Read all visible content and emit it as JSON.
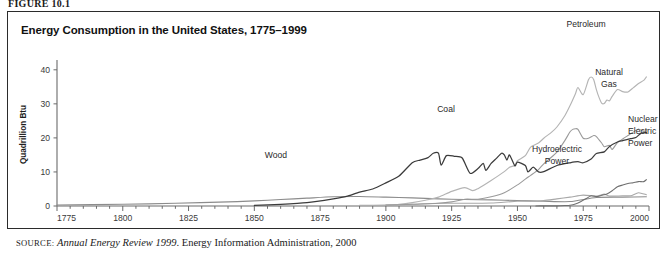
{
  "figure": {
    "label": "FIGURE 10.1",
    "title": "Energy Consumption in the United States, 1775–1999",
    "source_prefix": "source:",
    "source_italic": "Annual Energy Review 1999",
    "source_rest": ". Energy Information Administration, 2000"
  },
  "axes": {
    "ylabel": "Quadrillion Btu",
    "yticks": [
      "0",
      "10",
      "20",
      "30",
      "40"
    ],
    "xticks": [
      "1775",
      "1800",
      "1825",
      "1850",
      "1875",
      "1900",
      "1925",
      "1950",
      "1975",
      "2000"
    ]
  },
  "labels": {
    "wood": "Wood",
    "coal": "Coal",
    "petroleum": "Petroleum",
    "natural_gas_l1": "Natural",
    "natural_gas_l2": "Gas",
    "hydro_l1": "Hydroelectric",
    "hydro_l2": "Power",
    "nuclear_l1": "Nuclear",
    "nuclear_l2": "Electric",
    "nuclear_l3": "Power"
  },
  "colors": {
    "wood": "#8c8c8c",
    "coal": "#3b3b3b",
    "petroleum": "#b4b4b4",
    "natural_gas": "#9a9a9a",
    "hydro": "#a8a8a8",
    "nuclear": "#6f6f6f",
    "axis": "#6b6b6b",
    "border": "#2b2b2b"
  },
  "chart_data": {
    "type": "line",
    "title": "Energy Consumption in the United States, 1775–1999",
    "xlabel": "",
    "ylabel": "Quadrillion Btu",
    "xlim": [
      1775,
      2000
    ],
    "ylim": [
      0,
      42
    ],
    "yticks": [
      0,
      10,
      20,
      30,
      40
    ],
    "xticks": [
      1775,
      1800,
      1825,
      1850,
      1875,
      1900,
      1925,
      1950,
      1975,
      2000
    ],
    "grid": false,
    "legend": "inline-annotations",
    "units": "Quadrillion Btu",
    "series": [
      {
        "name": "Wood",
        "color": "#8c8c8c",
        "points": [
          [
            1775,
            0.3
          ],
          [
            1800,
            0.5
          ],
          [
            1820,
            0.8
          ],
          [
            1840,
            1.2
          ],
          [
            1850,
            1.5
          ],
          [
            1860,
            1.9
          ],
          [
            1870,
            2.3
          ],
          [
            1880,
            2.7
          ],
          [
            1890,
            2.8
          ],
          [
            1900,
            2.6
          ],
          [
            1910,
            2.4
          ],
          [
            1920,
            2.1
          ],
          [
            1930,
            1.9
          ],
          [
            1940,
            1.8
          ],
          [
            1950,
            1.6
          ],
          [
            1960,
            1.4
          ],
          [
            1970,
            1.3
          ],
          [
            1980,
            2.5
          ],
          [
            1990,
            2.6
          ],
          [
            1999,
            2.7
          ]
        ]
      },
      {
        "name": "Coal",
        "color": "#3b3b3b",
        "points": [
          [
            1850,
            0.2
          ],
          [
            1860,
            0.5
          ],
          [
            1870,
            1.0
          ],
          [
            1880,
            2.1
          ],
          [
            1885,
            2.8
          ],
          [
            1890,
            4.1
          ],
          [
            1895,
            5.0
          ],
          [
            1900,
            6.8
          ],
          [
            1905,
            8.8
          ],
          [
            1910,
            12.7
          ],
          [
            1913,
            13.5
          ],
          [
            1916,
            14.2
          ],
          [
            1918,
            15.5
          ],
          [
            1920,
            15.5
          ],
          [
            1921,
            12.0
          ],
          [
            1923,
            14.8
          ],
          [
            1926,
            14.6
          ],
          [
            1929,
            14.1
          ],
          [
            1932,
            9.6
          ],
          [
            1935,
            11.0
          ],
          [
            1937,
            12.5
          ],
          [
            1938,
            10.5
          ],
          [
            1940,
            12.5
          ],
          [
            1942,
            14.0
          ],
          [
            1944,
            15.5
          ],
          [
            1945,
            15.0
          ],
          [
            1946,
            13.5
          ],
          [
            1947,
            15.0
          ],
          [
            1949,
            11.8
          ],
          [
            1950,
            12.9
          ],
          [
            1953,
            11.9
          ],
          [
            1954,
            10.0
          ],
          [
            1956,
            11.4
          ],
          [
            1958,
            10.0
          ],
          [
            1960,
            10.1
          ],
          [
            1965,
            11.9
          ],
          [
            1970,
            12.7
          ],
          [
            1973,
            13.0
          ],
          [
            1975,
            12.7
          ],
          [
            1978,
            13.8
          ],
          [
            1980,
            15.4
          ],
          [
            1983,
            15.9
          ],
          [
            1985,
            17.5
          ],
          [
            1988,
            18.8
          ],
          [
            1990,
            19.2
          ],
          [
            1993,
            19.8
          ],
          [
            1995,
            20.1
          ],
          [
            1997,
            21.4
          ],
          [
            1999,
            21.6
          ]
        ]
      },
      {
        "name": "Petroleum",
        "color": "#b4b4b4",
        "points": [
          [
            1900,
            0.2
          ],
          [
            1905,
            0.5
          ],
          [
            1910,
            1.0
          ],
          [
            1915,
            1.7
          ],
          [
            1920,
            2.6
          ],
          [
            1925,
            4.3
          ],
          [
            1930,
            5.4
          ],
          [
            1933,
            4.5
          ],
          [
            1935,
            5.1
          ],
          [
            1940,
            7.5
          ],
          [
            1945,
            10.1
          ],
          [
            1947,
            11.4
          ],
          [
            1949,
            11.9
          ],
          [
            1950,
            13.3
          ],
          [
            1953,
            14.8
          ],
          [
            1955,
            17.3
          ],
          [
            1958,
            18.5
          ],
          [
            1960,
            19.9
          ],
          [
            1963,
            21.7
          ],
          [
            1965,
            23.2
          ],
          [
            1968,
            26.5
          ],
          [
            1970,
            29.5
          ],
          [
            1972,
            32.9
          ],
          [
            1973,
            34.8
          ],
          [
            1975,
            32.7
          ],
          [
            1977,
            37.1
          ],
          [
            1978,
            37.9
          ],
          [
            1979,
            37.1
          ],
          [
            1980,
            34.2
          ],
          [
            1981,
            31.9
          ],
          [
            1982,
            30.2
          ],
          [
            1983,
            30.1
          ],
          [
            1984,
            31.1
          ],
          [
            1985,
            30.9
          ],
          [
            1986,
            32.2
          ],
          [
            1988,
            34.2
          ],
          [
            1990,
            33.6
          ],
          [
            1992,
            33.5
          ],
          [
            1994,
            34.7
          ],
          [
            1996,
            36.0
          ],
          [
            1998,
            36.9
          ],
          [
            1999,
            37.9
          ]
        ]
      },
      {
        "name": "Natural Gas",
        "color": "#9a9a9a",
        "points": [
          [
            1900,
            0.25
          ],
          [
            1910,
            0.5
          ],
          [
            1920,
            0.8
          ],
          [
            1925,
            1.2
          ],
          [
            1930,
            2.0
          ],
          [
            1935,
            2.0
          ],
          [
            1940,
            2.7
          ],
          [
            1945,
            3.9
          ],
          [
            1950,
            6.2
          ],
          [
            1953,
            7.9
          ],
          [
            1955,
            9.0
          ],
          [
            1958,
            10.7
          ],
          [
            1960,
            12.4
          ],
          [
            1963,
            14.4
          ],
          [
            1965,
            15.8
          ],
          [
            1968,
            19.2
          ],
          [
            1970,
            21.8
          ],
          [
            1971,
            22.5
          ],
          [
            1972,
            22.7
          ],
          [
            1973,
            22.5
          ],
          [
            1975,
            19.9
          ],
          [
            1977,
            19.9
          ],
          [
            1979,
            20.7
          ],
          [
            1980,
            20.4
          ],
          [
            1982,
            18.5
          ],
          [
            1983,
            17.4
          ],
          [
            1985,
            17.8
          ],
          [
            1986,
            16.6
          ],
          [
            1988,
            18.6
          ],
          [
            1990,
            19.7
          ],
          [
            1992,
            20.7
          ],
          [
            1994,
            21.7
          ],
          [
            1996,
            22.6
          ],
          [
            1998,
            21.9
          ],
          [
            1999,
            22.1
          ]
        ]
      },
      {
        "name": "Hydroelectric Power",
        "color": "#a8a8a8",
        "points": [
          [
            1890,
            0.2
          ],
          [
            1900,
            0.25
          ],
          [
            1910,
            0.5
          ],
          [
            1920,
            0.8
          ],
          [
            1930,
            0.8
          ],
          [
            1940,
            0.9
          ],
          [
            1950,
            1.4
          ],
          [
            1955,
            1.4
          ],
          [
            1960,
            1.6
          ],
          [
            1965,
            2.1
          ],
          [
            1970,
            2.6
          ],
          [
            1975,
            3.2
          ],
          [
            1980,
            2.9
          ],
          [
            1983,
            3.5
          ],
          [
            1985,
            2.9
          ],
          [
            1990,
            3.0
          ],
          [
            1993,
            3.0
          ],
          [
            1996,
            3.9
          ],
          [
            1999,
            3.3
          ]
        ]
      },
      {
        "name": "Nuclear Electric Power",
        "color": "#6f6f6f",
        "points": [
          [
            1957,
            0.02
          ],
          [
            1960,
            0.03
          ],
          [
            1965,
            0.04
          ],
          [
            1968,
            0.14
          ],
          [
            1970,
            0.24
          ],
          [
            1972,
            0.58
          ],
          [
            1974,
            1.27
          ],
          [
            1976,
            2.11
          ],
          [
            1978,
            3.02
          ],
          [
            1980,
            2.74
          ],
          [
            1982,
            3.13
          ],
          [
            1984,
            3.55
          ],
          [
            1986,
            4.47
          ],
          [
            1988,
            5.66
          ],
          [
            1990,
            6.16
          ],
          [
            1992,
            6.61
          ],
          [
            1994,
            6.84
          ],
          [
            1996,
            7.17
          ],
          [
            1998,
            7.16
          ],
          [
            1999,
            7.73
          ]
        ]
      }
    ]
  }
}
